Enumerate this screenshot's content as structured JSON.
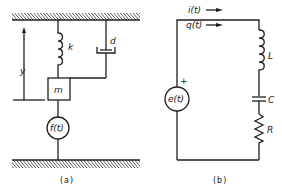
{
  "figure_a": {
    "caption": "(a)",
    "labels": {
      "spring": "k",
      "damper": "d",
      "mass": "m",
      "force": "f(t)",
      "displacement": "y"
    }
  },
  "figure_b": {
    "caption": "(b)",
    "labels": {
      "current": "i(t)",
      "charge": "q(t)",
      "source": "e(t)",
      "source_polarity": "+",
      "inductor": "L",
      "capacitor": "C",
      "resistor": "R"
    }
  },
  "colors": {
    "line": "#1f1f1f",
    "background": "#ffffff"
  }
}
